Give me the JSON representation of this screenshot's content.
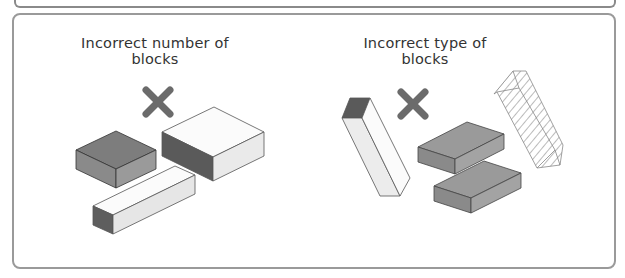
{
  "panels": [
    {
      "caption": "Incorrect number of blocks",
      "mark": "x-mark-icon",
      "blocks": [
        "dark-gray-square-block",
        "large-white-block-dark-side",
        "long-white-bar-block"
      ]
    },
    {
      "caption": "Incorrect type of blocks",
      "mark": "x-mark-icon",
      "blocks": [
        "tilted-white-column-block",
        "gray-brick-block-upper",
        "gray-brick-block-lower",
        "hatched-transparent-block"
      ]
    }
  ],
  "colors": {
    "x_mark": "#6b6b6b",
    "frame_border": "#9a9a9a",
    "dark_face": "#5a5a5a",
    "mid_face": "#8c8c8c",
    "light_face": "#e8e8e8"
  }
}
